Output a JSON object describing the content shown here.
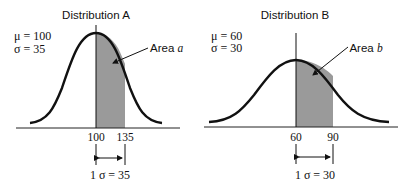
{
  "diagram": {
    "panels": [
      {
        "title": "Distribution A",
        "mu_label": "μ = 100",
        "sigma_label": "σ = 35",
        "area_label_prefix": "Area ",
        "area_label_var": "a",
        "mean_tick": "100",
        "sd_tick": "135",
        "interval_label": "1 σ = 35"
      },
      {
        "title": "Distribution B",
        "mu_label": "μ = 60",
        "sigma_label": "σ = 30",
        "area_label_prefix": "Area ",
        "area_label_var": "b",
        "mean_tick": "60",
        "sd_tick": "90",
        "interval_label": "1 σ = 30"
      }
    ],
    "colors": {
      "curve": "#111111",
      "shade": "#9a9a9a",
      "axis": "#222222"
    }
  }
}
